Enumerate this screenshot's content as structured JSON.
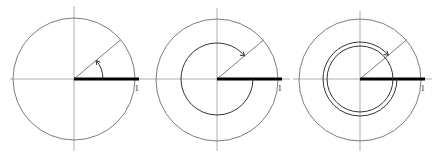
{
  "diagram": {
    "colors": {
      "axis": "#9a9a9a",
      "circle": "#6e6e6e",
      "unit_bar": "#000000",
      "arc": "#333333"
    },
    "panels": [
      {
        "id": "panel-1",
        "center": [
          74,
          79
        ],
        "radius": 61,
        "ray_angle_deg": 40,
        "turns": 0,
        "arc_radii": [
          29
        ],
        "unit_label": "1"
      },
      {
        "id": "panel-2",
        "center": [
          217,
          79
        ],
        "radius": 61,
        "ray_angle_deg": 40,
        "turns": 1,
        "arc_radii": [
          36
        ],
        "unit_label": "1"
      },
      {
        "id": "panel-3",
        "center": [
          360,
          79
        ],
        "radius": 61,
        "ray_angle_deg": 40,
        "turns": 2,
        "arc_radii": [
          33,
          37
        ],
        "unit_label": "1"
      }
    ]
  }
}
